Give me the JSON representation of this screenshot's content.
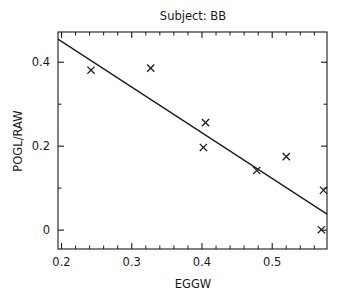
{
  "chart_data": {
    "type": "scatter",
    "title": "Subject: BB",
    "xlabel": "EGGW",
    "ylabel": "POGL/RAW",
    "xlim": [
      0.195,
      0.578
    ],
    "ylim": [
      -0.045,
      0.472
    ],
    "grid": false,
    "legend": null,
    "x_ticks": [
      0.2,
      0.3,
      0.4,
      0.5
    ],
    "x_tick_labels": [
      "0.2",
      "0.3",
      "0.4",
      "0.5"
    ],
    "x_minor_ticks": [
      0.22,
      0.24,
      0.26,
      0.28,
      0.32,
      0.34,
      0.36,
      0.38,
      0.42,
      0.44,
      0.46,
      0.48,
      0.52,
      0.54,
      0.56
    ],
    "y_ticks": [
      0,
      0.2,
      0.4
    ],
    "y_tick_labels": [
      "0",
      "0.2",
      "0.4"
    ],
    "y_minor_ticks": [
      0.1,
      0.3
    ],
    "marker": "x",
    "series": [
      {
        "name": "observations",
        "points": [
          {
            "x": 0.242,
            "y": 0.381
          },
          {
            "x": 0.327,
            "y": 0.386
          },
          {
            "x": 0.405,
            "y": 0.256
          },
          {
            "x": 0.402,
            "y": 0.197
          },
          {
            "x": 0.478,
            "y": 0.142
          },
          {
            "x": 0.52,
            "y": 0.175
          },
          {
            "x": 0.573,
            "y": 0.095
          },
          {
            "x": 0.57,
            "y": 0.001
          }
        ]
      }
    ],
    "fit_line": {
      "name": "linear-fit",
      "x_start": 0.195,
      "y_start": 0.455,
      "x_end": 0.578,
      "y_end": 0.038
    }
  },
  "axes": {
    "title_text": "Subject: BB",
    "x_axis_title": "EGGW",
    "y_axis_title": "POGL/RAW"
  }
}
